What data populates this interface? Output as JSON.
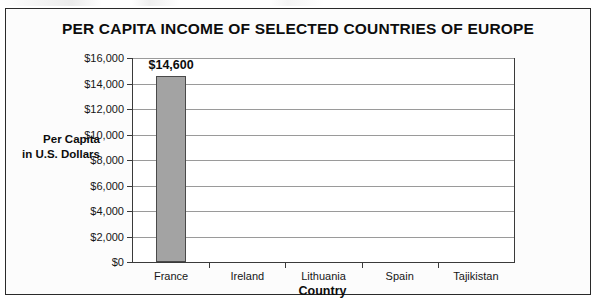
{
  "chart_data": {
    "type": "bar",
    "title": "PER CAPITA INCOME OF SELECTED COUNTRIES OF EUROPE",
    "xlabel": "Country",
    "ylabel_line1": "Per Capita",
    "ylabel_line2": "in U.S. Dollars",
    "categories": [
      "France",
      "Ireland",
      "Lithuania",
      "Spain",
      "Tajikistan"
    ],
    "values": [
      14600,
      null,
      null,
      null,
      null
    ],
    "value_labels": [
      "$14,600",
      "",
      "",
      "",
      ""
    ],
    "ylim": [
      0,
      16000
    ],
    "ytick_values": [
      0,
      2000,
      4000,
      6000,
      8000,
      10000,
      12000,
      14000,
      16000
    ],
    "ytick_labels": [
      "$0",
      "$2,000",
      "$4,000",
      "$6,000",
      "$8,000",
      "$10,000",
      "$12,000",
      "$14,000",
      "$16,000"
    ],
    "grid": true,
    "legend": null,
    "bar_color": "#a3a3a3",
    "bar_edge_color": "#4a4a4a",
    "axis_color": "#3a3a3a",
    "grid_color": "#9a9a9a",
    "plot_background": "#ffffff",
    "figure_background": "#fcfcfc"
  }
}
